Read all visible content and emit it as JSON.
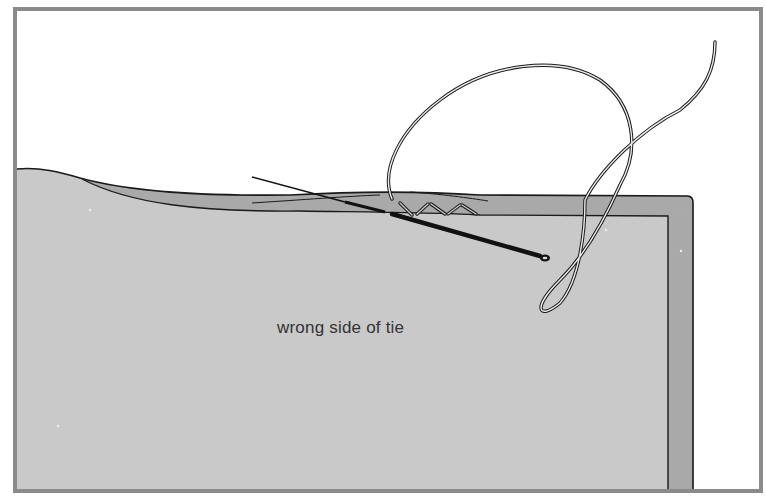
{
  "illustration": {
    "subject": "slip-stitching the hem of a tie with needle and thread",
    "label": "wrong side of tie",
    "colors": {
      "background": "#ffffff",
      "frame": "#8a8a8a",
      "fabric": "#c9c9c9",
      "hem_fold": "#a9a9a9",
      "outline": "#1a1a1a",
      "needle": "#111111",
      "thread": "#b5b5b5"
    }
  }
}
